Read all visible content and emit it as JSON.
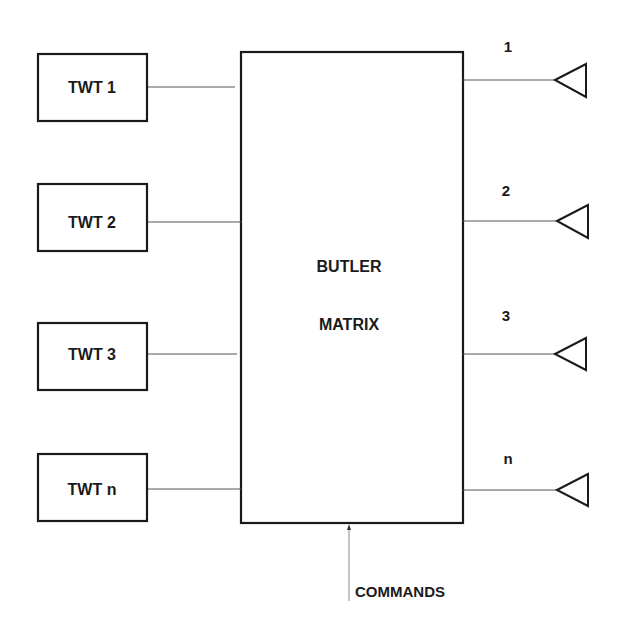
{
  "diagram": {
    "matrix": {
      "line1": "BUTLER",
      "line2": "MATRIX"
    },
    "inputs": [
      {
        "label": "TWT 1"
      },
      {
        "label": "TWT 2"
      },
      {
        "label": "TWT 3"
      },
      {
        "label": "TWT n"
      }
    ],
    "outputs": [
      {
        "label": "1",
        "icon": "antenna-triangle-icon"
      },
      {
        "label": "2",
        "icon": "antenna-triangle-icon"
      },
      {
        "label": "3",
        "icon": "antenna-triangle-icon"
      },
      {
        "label": "n",
        "icon": "antenna-triangle-icon"
      }
    ],
    "control": {
      "label": "COMMANDS"
    }
  }
}
